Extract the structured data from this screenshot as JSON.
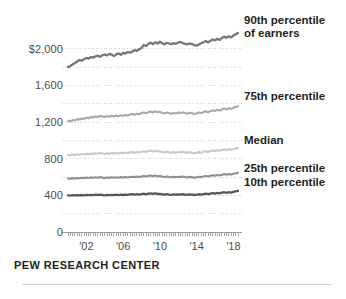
{
  "footer": {
    "source": "PEW RESEARCH CENTER"
  },
  "axis": {
    "y_ticks": [
      "$2,000",
      "1,600",
      "1,200",
      "800",
      "400",
      "0"
    ],
    "x_ticks": [
      "'02",
      "'06",
      "'10",
      "'14",
      "'18"
    ]
  },
  "legend": {
    "p90_line1": "90th percentile",
    "p90_line2": "of earners",
    "p75": "75th percentile",
    "median": "Median",
    "p25": "25th percentile",
    "p10": "10th percentile"
  },
  "colors": {
    "p90": "#767676",
    "p75": "#a8a8a8",
    "median": "#c9c9c9",
    "p25": "#8f8f8f",
    "p10": "#58585a",
    "gridline": "#cfcfcf",
    "axis": "#9a9a9a",
    "text": "#231f20",
    "tick_text": "#4d4d4d",
    "background": "#ffffff"
  },
  "chart_data": {
    "type": "line",
    "title": "",
    "subtitle": "",
    "xlabel": "",
    "ylabel": "",
    "ylim": [
      0,
      2200
    ],
    "xlim": [
      2000,
      2018.75
    ],
    "grid": true,
    "gridlines": [
      0,
      200,
      400,
      600,
      800,
      1000,
      1200,
      1400,
      1600,
      1800,
      2000
    ],
    "legend_position": "right-direct-label",
    "x": [
      2000.0,
      2000.25,
      2000.5,
      2000.75,
      2001.0,
      2001.25,
      2001.5,
      2001.75,
      2002.0,
      2002.25,
      2002.5,
      2002.75,
      2003.0,
      2003.25,
      2003.5,
      2003.75,
      2004.0,
      2004.25,
      2004.5,
      2004.75,
      2005.0,
      2005.25,
      2005.5,
      2005.75,
      2006.0,
      2006.25,
      2006.5,
      2006.75,
      2007.0,
      2007.25,
      2007.5,
      2007.75,
      2008.0,
      2008.25,
      2008.5,
      2008.75,
      2009.0,
      2009.25,
      2009.5,
      2009.75,
      2010.0,
      2010.25,
      2010.5,
      2010.75,
      2011.0,
      2011.25,
      2011.5,
      2011.75,
      2012.0,
      2012.25,
      2012.5,
      2012.75,
      2013.0,
      2013.25,
      2013.5,
      2013.75,
      2014.0,
      2014.25,
      2014.5,
      2014.75,
      2015.0,
      2015.25,
      2015.5,
      2015.75,
      2016.0,
      2016.25,
      2016.5,
      2016.75,
      2017.0,
      2017.25,
      2017.5,
      2017.75,
      2018.0,
      2018.25,
      2018.5
    ],
    "series": [
      {
        "name": "90th percentile of earners",
        "color": "#767676",
        "values": [
          1800,
          1812,
          1830,
          1845,
          1862,
          1878,
          1870,
          1888,
          1900,
          1893,
          1910,
          1905,
          1918,
          1925,
          1912,
          1930,
          1938,
          1928,
          1945,
          1936,
          1920,
          1940,
          1950,
          1935,
          1955,
          1948,
          1965,
          1958,
          1972,
          1985,
          1978,
          1995,
          2008,
          2042,
          2030,
          2055,
          2068,
          2050,
          2072,
          2058,
          2078,
          2060,
          2048,
          2066,
          2058,
          2050,
          2062,
          2055,
          2068,
          2075,
          2062,
          2055,
          2048,
          2060,
          2052,
          2040,
          2035,
          2048,
          2060,
          2072,
          2085,
          2070,
          2088,
          2100,
          2092,
          2110,
          2098,
          2118,
          2132,
          2120,
          2138,
          2125,
          2145,
          2160,
          2172
        ]
      },
      {
        "name": "75th percentile",
        "color": "#a8a8a8",
        "values": [
          1215,
          1208,
          1222,
          1218,
          1232,
          1228,
          1240,
          1235,
          1248,
          1242,
          1255,
          1250,
          1262,
          1256,
          1268,
          1262,
          1255,
          1265,
          1258,
          1270,
          1262,
          1272,
          1265,
          1275,
          1268,
          1278,
          1272,
          1282,
          1288,
          1280,
          1292,
          1286,
          1298,
          1305,
          1296,
          1308,
          1315,
          1305,
          1318,
          1308,
          1312,
          1302,
          1295,
          1305,
          1298,
          1290,
          1300,
          1294,
          1305,
          1298,
          1308,
          1300,
          1292,
          1302,
          1296,
          1288,
          1295,
          1305,
          1298,
          1310,
          1318,
          1308,
          1320,
          1330,
          1322,
          1335,
          1326,
          1340,
          1348,
          1338,
          1352,
          1345,
          1358,
          1365,
          1372
        ]
      },
      {
        "name": "Median",
        "color": "#c9c9c9",
        "values": [
          840,
          836,
          845,
          840,
          848,
          843,
          852,
          847,
          855,
          850,
          858,
          853,
          860,
          855,
          862,
          857,
          852,
          860,
          855,
          862,
          856,
          864,
          858,
          866,
          860,
          868,
          862,
          870,
          872,
          866,
          874,
          868,
          876,
          882,
          874,
          884,
          888,
          880,
          888,
          880,
          882,
          874,
          870,
          876,
          870,
          865,
          872,
          866,
          874,
          868,
          876,
          870,
          864,
          872,
          866,
          860,
          865,
          872,
          866,
          876,
          882,
          874,
          884,
          890,
          884,
          892,
          886,
          896,
          902,
          894,
          904,
          898,
          906,
          912,
          918
        ]
      },
      {
        "name": "25th percentile",
        "color": "#8f8f8f",
        "values": [
          585,
          582,
          588,
          584,
          590,
          586,
          592,
          588,
          594,
          590,
          596,
          592,
          598,
          593,
          599,
          594,
          590,
          596,
          591,
          597,
          592,
          598,
          593,
          599,
          594,
          600,
          595,
          601,
          604,
          599,
          605,
          600,
          606,
          612,
          605,
          614,
          617,
          610,
          616,
          609,
          611,
          605,
          601,
          606,
          601,
          597,
          602,
          598,
          604,
          599,
          605,
          600,
          596,
          602,
          598,
          594,
          598,
          604,
          599,
          607,
          612,
          606,
          614,
          620,
          615,
          622,
          617,
          626,
          632,
          625,
          634,
          628,
          636,
          642,
          648
        ]
      },
      {
        "name": "10th percentile",
        "color": "#58585a",
        "values": [
          400,
          398,
          402,
          399,
          403,
          400,
          404,
          401,
          405,
          402,
          406,
          403,
          407,
          404,
          408,
          404,
          401,
          405,
          402,
          406,
          402,
          407,
          403,
          408,
          404,
          409,
          405,
          410,
          412,
          408,
          413,
          409,
          414,
          418,
          412,
          420,
          422,
          416,
          421,
          415,
          417,
          412,
          409,
          413,
          409,
          406,
          410,
          407,
          411,
          408,
          412,
          409,
          406,
          410,
          407,
          404,
          407,
          412,
          408,
          414,
          418,
          413,
          419,
          424,
          420,
          426,
          422,
          429,
          434,
          428,
          436,
          431,
          438,
          444,
          450
        ]
      }
    ]
  }
}
